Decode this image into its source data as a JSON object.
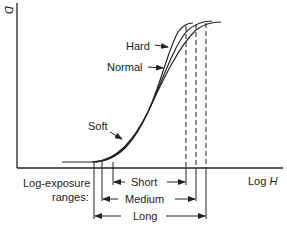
{
  "diagram": {
    "y_axis_label": "D",
    "x_axis_label_prefix": "Log ",
    "x_axis_label_var": "H",
    "curves": [
      {
        "name": "Hard",
        "label": "Hard"
      },
      {
        "name": "Normal",
        "label": "Normal"
      },
      {
        "name": "Soft",
        "label": "Soft"
      }
    ],
    "ranges_label_line1": "Log-exposure",
    "ranges_label_line2": "ranges:",
    "ranges": [
      {
        "name": "Short",
        "label": "Short"
      },
      {
        "name": "Medium",
        "label": "Medium"
      },
      {
        "name": "Long",
        "label": "Long"
      }
    ],
    "colors": {
      "line": "#222222",
      "background": "#ffffff"
    }
  }
}
